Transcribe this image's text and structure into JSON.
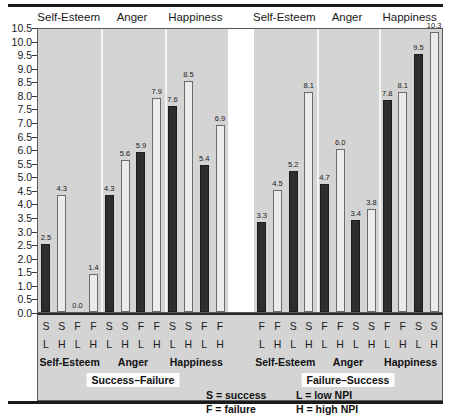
{
  "chart_data": {
    "type": "bar",
    "title": "",
    "xlabel": "",
    "ylabel": "",
    "ylim": [
      0.0,
      10.5
    ],
    "ytick_step": 0.5,
    "grid": false,
    "legend_position": "bottom-right",
    "yticks": [
      "10.5",
      "10.0",
      "9.5",
      "9.0",
      "8.5",
      "8.0",
      "7.5",
      "7.0",
      "6.5",
      "6.0",
      "5.5",
      "5.0",
      "4.5",
      "4.0",
      "3.5",
      "3.0",
      "2.5",
      "2.0",
      "1.5",
      "1.0",
      "0.5",
      "0.0"
    ],
    "series": [
      {
        "name": "low NPI",
        "key": "L",
        "color": "#2e2e2e",
        "style": "dark-filled"
      },
      {
        "name": "high NPI",
        "key": "H",
        "color": "#ececed",
        "style": "light-open"
      }
    ],
    "panels": [
      {
        "condition": "Success–Failure",
        "groups": [
          {
            "measure": "Self-Esteem",
            "bars": [
              {
                "outcome": "S",
                "npi": "L",
                "value": 2.5,
                "label": "2.5",
                "style": "dark"
              },
              {
                "outcome": "S",
                "npi": "H",
                "value": 4.3,
                "label": "4.3",
                "style": "light"
              },
              {
                "outcome": "F",
                "npi": "L",
                "value": 0.0,
                "label": "0.0",
                "style": "zero"
              },
              {
                "outcome": "F",
                "npi": "H",
                "value": 1.4,
                "label": "1.4",
                "style": "light"
              }
            ]
          },
          {
            "measure": "Anger",
            "bars": [
              {
                "outcome": "S",
                "npi": "L",
                "value": 4.3,
                "label": "4.3",
                "style": "dark"
              },
              {
                "outcome": "S",
                "npi": "H",
                "value": 5.6,
                "label": "5.6",
                "style": "light"
              },
              {
                "outcome": "F",
                "npi": "L",
                "value": 5.9,
                "label": "5.9",
                "style": "dark"
              },
              {
                "outcome": "F",
                "npi": "H",
                "value": 7.9,
                "label": "7.9",
                "style": "light"
              }
            ]
          },
          {
            "measure": "Happiness",
            "bars": [
              {
                "outcome": "S",
                "npi": "L",
                "value": 7.6,
                "label": "7.6",
                "style": "dark"
              },
              {
                "outcome": "S",
                "npi": "H",
                "value": 8.5,
                "label": "8.5",
                "style": "light"
              },
              {
                "outcome": "F",
                "npi": "L",
                "value": 5.4,
                "label": "5.4",
                "style": "dark"
              },
              {
                "outcome": "F",
                "npi": "H",
                "value": 6.9,
                "label": "6.9",
                "style": "light"
              }
            ]
          }
        ]
      },
      {
        "condition": "Failure–Success",
        "groups": [
          {
            "measure": "Self-Esteem",
            "bars": [
              {
                "outcome": "F",
                "npi": "L",
                "value": 3.3,
                "label": "3.3",
                "style": "dark"
              },
              {
                "outcome": "F",
                "npi": "H",
                "value": 4.5,
                "label": "4.5",
                "style": "light"
              },
              {
                "outcome": "S",
                "npi": "L",
                "value": 5.2,
                "label": "5.2",
                "style": "dark"
              },
              {
                "outcome": "S",
                "npi": "H",
                "value": 8.1,
                "label": "8.1",
                "style": "light"
              }
            ]
          },
          {
            "measure": "Anger",
            "bars": [
              {
                "outcome": "F",
                "npi": "L",
                "value": 4.7,
                "label": "4.7",
                "style": "dark"
              },
              {
                "outcome": "F",
                "npi": "H",
                "value": 6.0,
                "label": "6.0",
                "style": "light"
              },
              {
                "outcome": "S",
                "npi": "L",
                "value": 3.4,
                "label": "3.4",
                "style": "dark"
              },
              {
                "outcome": "S",
                "npi": "H",
                "value": 3.8,
                "label": "3.8",
                "style": "light"
              }
            ]
          },
          {
            "measure": "Happiness",
            "bars": [
              {
                "outcome": "F",
                "npi": "L",
                "value": 7.8,
                "label": "7.8",
                "style": "dark"
              },
              {
                "outcome": "F",
                "npi": "H",
                "value": 8.1,
                "label": "8.1",
                "style": "light"
              },
              {
                "outcome": "S",
                "npi": "L",
                "value": 9.5,
                "label": "9.5",
                "style": "dark"
              },
              {
                "outcome": "S",
                "npi": "H",
                "value": 10.3,
                "label": "10.3",
                "style": "light"
              }
            ]
          }
        ]
      }
    ],
    "legend_entries": [
      "S = success",
      "F = failure",
      "L = low NPI",
      "H = high NPI"
    ],
    "annotations": []
  }
}
